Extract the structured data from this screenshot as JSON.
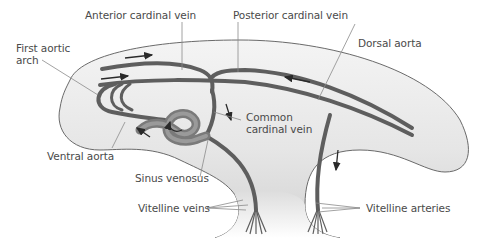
{
  "diagram": {
    "type": "anatomical-illustration",
    "colors": {
      "body_fill_light": "#f2f2f2",
      "body_fill_dark": "#d4d4d4",
      "body_outline": "#6a6a6a",
      "vessel": "#5e5e5e",
      "heart": "#7a7a7a",
      "arrow": "#2a2a2a",
      "label_text": "#4a4a4a",
      "leader_line": "#8a8a8a"
    },
    "labels": {
      "anterior_cardinal_vein": "Anterior cardinal vein",
      "posterior_cardinal_vein": "Posterior cardinal vein",
      "dorsal_aorta": "Dorsal aorta",
      "first_aortic_arch_line1": "First aortic",
      "first_aortic_arch_line2": "arch",
      "common_cardinal_vein_line1": "Common",
      "common_cardinal_vein_line2": "cardinal vein",
      "ventral_aorta": "Ventral aorta",
      "sinus_venosus": "Sinus venosus",
      "vitelline_veins": "Vitelline veins",
      "vitelline_arteries": "Vitelline arteries"
    },
    "flow_arrows": [
      {
        "location": "above anterior cardinal vein",
        "direction": "right"
      },
      {
        "location": "near first aortic arch",
        "direction": "right"
      },
      {
        "location": "dorsal aorta",
        "direction": "left"
      },
      {
        "location": "common cardinal vein descending",
        "direction": "down"
      },
      {
        "location": "vitelline artery",
        "direction": "down"
      },
      {
        "location": "vitelline vein",
        "direction": "up"
      },
      {
        "location": "ventral aorta",
        "direction": "up-left"
      },
      {
        "location": "heart loop",
        "direction": "circular"
      }
    ]
  }
}
